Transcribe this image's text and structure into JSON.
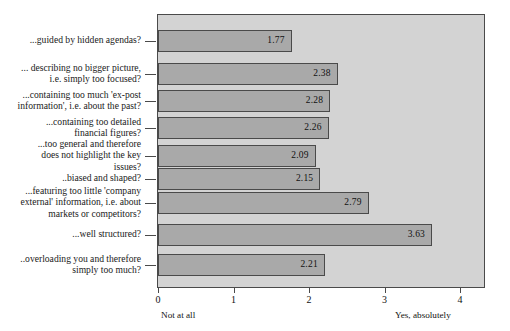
{
  "chart_data": {
    "type": "bar",
    "orientation": "horizontal",
    "title": "",
    "subtitle": "",
    "xlabel": "",
    "ylabel": "",
    "xlim": [
      0,
      4
    ],
    "xticks": [
      "0",
      "1",
      "2",
      "3",
      "4"
    ],
    "grid": false,
    "legend": false,
    "axis_end_labels": {
      "left": "Not at all",
      "right": "Yes, absolutely"
    },
    "categories": [
      "...guided by hidden agendas?",
      "... describing no bigger picture,\ni.e. simply too focused?",
      "...containing too much 'ex-post\ninformation', i.e. about the past?",
      "...containing too detailed\nfinancial figures?",
      "...too general and therefore\ndoes not highlight the key\nissues?",
      "..biased and shaped?",
      "...featuring too little 'company\nexternal' information, i.e. about\nmarkets or competitors?",
      "...well structured?",
      "..overloading you and therefore\nsimply too much?"
    ],
    "values": [
      1.77,
      2.38,
      2.28,
      2.26,
      2.09,
      2.15,
      2.79,
      3.63,
      2.21
    ],
    "value_labels": [
      "1.77",
      "2.38",
      "2.28",
      "2.26",
      "2.09",
      "2.15",
      "2.79",
      "3.63",
      "2.21"
    ],
    "colors": {
      "bar_fill": "#a9a9a9",
      "bar_border": "#4a4a4a",
      "plot_background": "#d3d3d3",
      "page_background": "#ffffff",
      "text": "#111111"
    }
  }
}
